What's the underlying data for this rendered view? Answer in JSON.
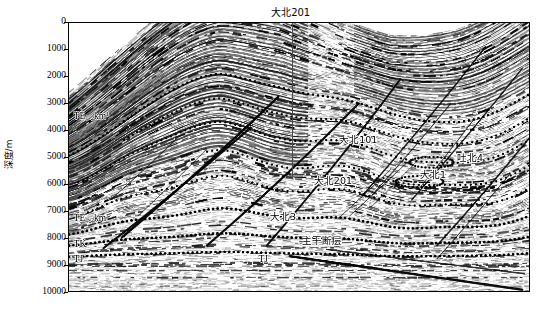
{
  "figure": {
    "type": "seismic-cross-section",
    "width": 544,
    "height": 309,
    "background": "#ffffff"
  },
  "yaxis": {
    "title": "深度/m",
    "unit": "m",
    "min": 0,
    "max": 10000,
    "step": 1000,
    "ticks": [
      "0",
      "1000",
      "2000",
      "3000",
      "4000",
      "5000",
      "6000",
      "7000",
      "8000",
      "9000",
      "10000"
    ]
  },
  "wellhead": {
    "label": "大北201",
    "x_frac": 0.482,
    "depth_top": 0,
    "depth_bottom": 5700,
    "color": "#4a4a4a"
  },
  "well_labels": [
    {
      "text": "大北101",
      "x_frac": 0.585,
      "y_frac": 0.415
    },
    {
      "text": "大北201",
      "x_frac": 0.53,
      "y_frac": 0.565
    },
    {
      "text": "大北3",
      "x_frac": 0.435,
      "y_frac": 0.7
    },
    {
      "text": "吐北4",
      "x_frac": 0.84,
      "y_frac": 0.48
    },
    {
      "text": "大北1",
      "x_frac": 0.76,
      "y_frac": 0.545
    },
    {
      "text": "主干断层",
      "x_frac": 0.505,
      "y_frac": 0.79
    }
  ],
  "horizon_labels": [
    {
      "id": "te12km-upper",
      "base": "TE",
      "sub": "1-2",
      "tail": "km",
      "sup": "1",
      "x_frac": 0.01,
      "y_frac": 0.32
    },
    {
      "id": "te12km-lower",
      "base": "TE",
      "sub": "1-2",
      "tail": "km",
      "sup": "",
      "x_frac": 0.01,
      "y_frac": 0.705
    },
    {
      "id": "tk",
      "base": "TK",
      "sub": "",
      "tail": "",
      "sup": "",
      "x_frac": 0.01,
      "y_frac": 0.8
    },
    {
      "id": "tj-left",
      "base": "TJ",
      "sub": "",
      "tail": "",
      "sup": "",
      "x_frac": 0.01,
      "y_frac": 0.855
    },
    {
      "id": "tj-mid",
      "base": "TJ",
      "sub": "",
      "tail": "",
      "sup": "",
      "x_frac": 0.41,
      "y_frac": 0.855
    }
  ],
  "colors": {
    "ink": "#000000",
    "well_line": "#4a4a4a",
    "frame": "#000000",
    "fault_major": "#111111",
    "fault_minor": "#333333",
    "horizon_dotted": "#000000"
  },
  "chart_data": {
    "type": "heatmap",
    "title": "",
    "xlabel": "",
    "ylabel": "深度/m",
    "ylim": [
      0,
      10000
    ],
    "yticks": [
      0,
      1000,
      2000,
      3000,
      4000,
      5000,
      6000,
      7000,
      8000,
      9000,
      10000
    ],
    "grid": false,
    "legend": "none",
    "annotations": [
      {
        "label": "大北201",
        "kind": "wellhead",
        "x_frac": 0.482
      },
      {
        "label": "大北101",
        "kind": "well",
        "x_frac": 0.585,
        "y_frac": 0.415
      },
      {
        "label": "大北201",
        "kind": "well",
        "x_frac": 0.53,
        "y_frac": 0.565
      },
      {
        "label": "大北3",
        "kind": "well",
        "x_frac": 0.435,
        "y_frac": 0.7
      },
      {
        "label": "吐北4",
        "kind": "well",
        "x_frac": 0.84,
        "y_frac": 0.48
      },
      {
        "label": "大北1",
        "kind": "well",
        "x_frac": 0.76,
        "y_frac": 0.545
      },
      {
        "label": "主干断层",
        "kind": "fault",
        "x_frac": 0.505,
        "y_frac": 0.79
      },
      {
        "label": "TE1-2km1",
        "kind": "horizon",
        "x_frac": 0.01,
        "y_frac": 0.32
      },
      {
        "label": "TE1-2km",
        "kind": "horizon",
        "x_frac": 0.01,
        "y_frac": 0.705
      },
      {
        "label": "TK",
        "kind": "horizon",
        "x_frac": 0.01,
        "y_frac": 0.8
      },
      {
        "label": "TJ",
        "kind": "horizon",
        "x_frac": 0.01,
        "y_frac": 0.855
      },
      {
        "label": "TJ",
        "kind": "horizon",
        "x_frac": 0.41,
        "y_frac": 0.855
      }
    ]
  }
}
